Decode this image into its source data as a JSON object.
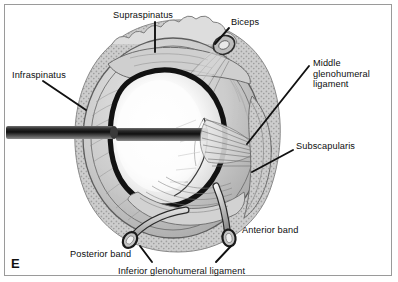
{
  "figure": {
    "panel_letter": "E",
    "view": "lateral glenoid view with humeral head removed",
    "style": "grayscale medical line illustration",
    "border_color": "#9a9a9a",
    "background_color": "#ffffff",
    "ink_color": "#0d0d0d"
  },
  "labels": {
    "supraspinatus": "Supraspinatus",
    "biceps": "Biceps",
    "middle_glenohumeral_ligament": "Middle\nglenohumeral\nligament",
    "subscapularis": "Subscapularis",
    "anterior_band": "Anterior band",
    "inferior_glenohumeral_ligament": "Inferior glenohumeral ligament",
    "posterior_band": "Posterior band",
    "infraspinatus": "Infraspinatus"
  },
  "colors": {
    "labrum_dark": "#1b1b1b",
    "capsule_gray": "#b9b9b9",
    "bone_light": "#e9e9e9",
    "glenoid_face": "#fbfbfb",
    "rim_stipple": "#cfcfcf",
    "probe_dark": "#141414",
    "leader_line": "#111111"
  }
}
